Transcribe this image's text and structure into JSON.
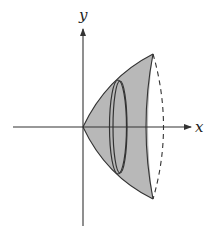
{
  "diagram": {
    "axes": {
      "x_label": "x",
      "y_label": "y"
    },
    "colors": {
      "shade": "#b8b8b8",
      "stroke": "#333333",
      "background": "#ffffff"
    },
    "elements": [
      "x-axis with arrow",
      "y-axis with arrow",
      "shaded paraboloid region",
      "disk cross-section ellipse (double outline)",
      "dashed back edge of solid"
    ]
  }
}
